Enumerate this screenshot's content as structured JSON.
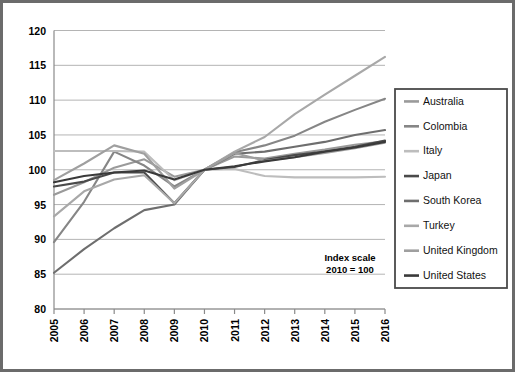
{
  "chart_data": {
    "type": "line",
    "title": "",
    "subtitle": "",
    "xlabel": "",
    "ylabel": "",
    "x": [
      2005,
      2006,
      2007,
      2008,
      2009,
      2010,
      2011,
      2012,
      2013,
      2014,
      2015,
      2016
    ],
    "categories": [
      "2005",
      "2006",
      "2007",
      "2008",
      "2009",
      "2010",
      "2011",
      "2012",
      "2013",
      "2014",
      "2015",
      "2016"
    ],
    "xlim": [
      2005,
      2016
    ],
    "ylim": [
      80,
      120
    ],
    "yticks": [
      80,
      85,
      90,
      95,
      100,
      105,
      110,
      115,
      120
    ],
    "xticks": [
      "2005",
      "2006",
      "2007",
      "2008",
      "2009",
      "2010",
      "2011",
      "2012",
      "2013",
      "2014",
      "2015",
      "2016"
    ],
    "grid": "horizontal",
    "legend_position": "right",
    "annotation": {
      "line1": "Index scale",
      "line2": "2010 = 100"
    },
    "series": [
      {
        "name": "Australia",
        "color": "#9a9a9a",
        "values": [
          96.4,
          98.2,
          100.3,
          101.5,
          99.0,
          100.0,
          101.9,
          101.6,
          102.3,
          102.9,
          103.6,
          104.1
        ]
      },
      {
        "name": "Colombia",
        "color": "#868686",
        "values": [
          89.6,
          95.4,
          102.6,
          100.6,
          97.6,
          100.0,
          102.5,
          103.5,
          104.9,
          106.9,
          108.6,
          110.2
        ]
      },
      {
        "name": "Italy",
        "color": "#bdbdbd",
        "values": [
          102.7,
          102.7,
          102.7,
          102.6,
          98.5,
          100.0,
          100.1,
          99.1,
          98.9,
          98.9,
          98.9,
          99.0
        ]
      },
      {
        "name": "Japan",
        "color": "#4a4a4a",
        "values": [
          97.6,
          98.3,
          99.6,
          99.6,
          95.2,
          100.0,
          100.4,
          101.4,
          102.1,
          102.6,
          103.3,
          104.2
        ]
      },
      {
        "name": "South Korea",
        "color": "#6e6e6e",
        "values": [
          85.2,
          88.6,
          91.6,
          94.2,
          95.0,
          100.0,
          102.3,
          102.6,
          103.3,
          104.0,
          105.0,
          105.7
        ]
      },
      {
        "name": "Turkey",
        "color": "#a8a8a8",
        "values": [
          93.3,
          96.9,
          98.6,
          99.2,
          95.2,
          100.0,
          102.6,
          104.7,
          108.0,
          110.8,
          113.5,
          116.2
        ]
      },
      {
        "name": "United Kingdom",
        "color": "#9f9f9f",
        "values": [
          98.5,
          100.9,
          103.5,
          102.3,
          97.3,
          100.0,
          102.4,
          101.3,
          101.8,
          102.4,
          103.1,
          103.9
        ]
      },
      {
        "name": "United States",
        "color": "#3a3a3a",
        "values": [
          98.2,
          99.1,
          99.6,
          99.9,
          98.6,
          100.0,
          100.5,
          101.2,
          101.8,
          102.6,
          103.2,
          104.0
        ]
      }
    ]
  },
  "legend": {
    "items": [
      {
        "label": "Australia"
      },
      {
        "label": "Colombia"
      },
      {
        "label": "Italy"
      },
      {
        "label": "Japan"
      },
      {
        "label": "South Korea"
      },
      {
        "label": "Turkey"
      },
      {
        "label": "United Kingdom"
      },
      {
        "label": "United States"
      }
    ]
  },
  "colors": {
    "frame": "#6b6b6b",
    "grid": "#b4b4b4",
    "axis": "#8a8a8a",
    "background": "#ffffff"
  }
}
